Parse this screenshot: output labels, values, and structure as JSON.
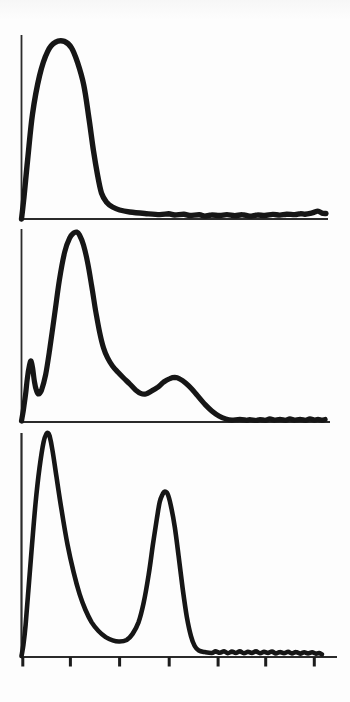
{
  "figure": {
    "kind": "scanned three-panel histogram figure",
    "background_color": "#fdfdfd",
    "ink_color": "#161616",
    "text": ""
  },
  "chart_data": [
    {
      "type": "line",
      "id": "panel-top",
      "title": "",
      "xlabel": "",
      "ylabel": "",
      "x_range": [
        0,
        100
      ],
      "y_range": [
        0,
        100
      ],
      "grid": false,
      "legend": "none",
      "units": "percent of axis span",
      "description": "Single broad peak near origin (apex ~14,96) with steep decay and long flat noisy tail",
      "points": [
        [
          0,
          0
        ],
        [
          0.7,
          10
        ],
        [
          2,
          32
        ],
        [
          3.6,
          57
        ],
        [
          5.9,
          78
        ],
        [
          8.5,
          91
        ],
        [
          11,
          96
        ],
        [
          14,
          96.5
        ],
        [
          16.3,
          93
        ],
        [
          18.3,
          85
        ],
        [
          20.3,
          73
        ],
        [
          21.9,
          56
        ],
        [
          23.5,
          37
        ],
        [
          24.8,
          24
        ],
        [
          26.1,
          14
        ],
        [
          27.8,
          9
        ],
        [
          29.7,
          6.5
        ],
        [
          32,
          4.9
        ],
        [
          35.3,
          3.8
        ],
        [
          40.2,
          3
        ],
        [
          45.1,
          2.4
        ],
        [
          48,
          2.8
        ],
        [
          50,
          2.2
        ],
        [
          53,
          2.6
        ],
        [
          54.9,
          1.9
        ],
        [
          58,
          2.3
        ],
        [
          59.8,
          1.6
        ],
        [
          62,
          2.2
        ],
        [
          64.7,
          1.9
        ],
        [
          67,
          2.4
        ],
        [
          69.6,
          1.8
        ],
        [
          72,
          2.3
        ],
        [
          74.5,
          1.6
        ],
        [
          77,
          2.2
        ],
        [
          79.4,
          1.9
        ],
        [
          82,
          2.5
        ],
        [
          84.3,
          2.1
        ],
        [
          86.5,
          2.6
        ],
        [
          89.2,
          2.4
        ],
        [
          91,
          2.9
        ],
        [
          92.5,
          2.6
        ],
        [
          94.8,
          3.3
        ],
        [
          96.7,
          4.3
        ],
        [
          98,
          3.2
        ],
        [
          99.3,
          3
        ]
      ]
    },
    {
      "type": "line",
      "id": "panel-middle",
      "title": "",
      "xlabel": "",
      "ylabel": "",
      "x_range": [
        0,
        100
      ],
      "y_range": [
        0,
        100
      ],
      "grid": false,
      "legend": "none",
      "units": "percent of axis span",
      "description": "Small sharp spike at ~3,32, tall main peak at ~18,98, shoulder decay, broad secondary bump at ~50,23, flat noisy tail",
      "points": [
        [
          0,
          0.5
        ],
        [
          0.6,
          6.2
        ],
        [
          1.3,
          14
        ],
        [
          1.9,
          22.8
        ],
        [
          2.6,
          29.5
        ],
        [
          3.1,
          31.6
        ],
        [
          3.6,
          28
        ],
        [
          4.2,
          20.7
        ],
        [
          4.9,
          16.1
        ],
        [
          5.5,
          14.5
        ],
        [
          6.5,
          16.6
        ],
        [
          7.8,
          24.4
        ],
        [
          9.1,
          37.3
        ],
        [
          10.7,
          55.4
        ],
        [
          12.3,
          73.6
        ],
        [
          14,
          88.1
        ],
        [
          15.6,
          95.3
        ],
        [
          16.9,
          97.9
        ],
        [
          17.9,
          98.4
        ],
        [
          18.8,
          96.9
        ],
        [
          20.1,
          91.7
        ],
        [
          21.4,
          82.9
        ],
        [
          22.7,
          71
        ],
        [
          24,
          58
        ],
        [
          25.3,
          46.6
        ],
        [
          26.6,
          38.3
        ],
        [
          27.9,
          33.2
        ],
        [
          29.5,
          29
        ],
        [
          31.2,
          25.9
        ],
        [
          33.1,
          22.8
        ],
        [
          35.1,
          19.7
        ],
        [
          37,
          16.6
        ],
        [
          38.6,
          14.8
        ],
        [
          40.3,
          14.5
        ],
        [
          42.2,
          16.1
        ],
        [
          44.2,
          18.1
        ],
        [
          46.1,
          20.7
        ],
        [
          48.1,
          22.5
        ],
        [
          49.7,
          23.1
        ],
        [
          51.3,
          22.3
        ],
        [
          53.2,
          20.2
        ],
        [
          55.2,
          17.1
        ],
        [
          57.1,
          13.5
        ],
        [
          59.4,
          9.3
        ],
        [
          61.7,
          5.7
        ],
        [
          64,
          3.1
        ],
        [
          66.2,
          1.6
        ],
        [
          68.2,
          1
        ],
        [
          70.8,
          1.4
        ],
        [
          73,
          0.9
        ],
        [
          74,
          1.3
        ],
        [
          76,
          0.8
        ],
        [
          77.3,
          1.3
        ],
        [
          79,
          0.9
        ],
        [
          80.5,
          1.6
        ],
        [
          82,
          1
        ],
        [
          83.8,
          1.4
        ],
        [
          85.5,
          0.9
        ],
        [
          87,
          1.6
        ],
        [
          88.5,
          1
        ],
        [
          90.3,
          1.4
        ],
        [
          92,
          0.9
        ],
        [
          93.5,
          1.6
        ],
        [
          95,
          1
        ],
        [
          96.1,
          1.4
        ],
        [
          97.3,
          1
        ],
        [
          98.4,
          1.3
        ]
      ]
    },
    {
      "type": "line",
      "id": "panel-bottom",
      "title": "",
      "xlabel": "",
      "ylabel": "",
      "x_range": [
        0,
        100
      ],
      "y_range": [
        0,
        100
      ],
      "grid": false,
      "legend": "none",
      "units": "percent of axis span",
      "description": "Tall narrow peak at ~8,100 and second narrow peak at ~45,74 with flat noisy tail; x axis has 7 tick marks",
      "x_ticks": [
        0.4,
        15.5,
        31.1,
        46.8,
        62.3,
        77.4,
        92.8
      ],
      "points": [
        [
          0,
          0.4
        ],
        [
          0.6,
          5.4
        ],
        [
          1.3,
          14.3
        ],
        [
          2.2,
          29.9
        ],
        [
          3.2,
          47.8
        ],
        [
          4.4,
          67.9
        ],
        [
          5.7,
          84.4
        ],
        [
          7,
          96
        ],
        [
          7.9,
          99.6
        ],
        [
          8.4,
          100
        ],
        [
          8.9,
          98.7
        ],
        [
          9.8,
          92.4
        ],
        [
          11.1,
          80.4
        ],
        [
          12.7,
          65.6
        ],
        [
          14.6,
          50
        ],
        [
          16.5,
          37.9
        ],
        [
          18.4,
          28.1
        ],
        [
          20.3,
          21
        ],
        [
          22.2,
          15.6
        ],
        [
          24.4,
          11.6
        ],
        [
          26.7,
          8.9
        ],
        [
          28.9,
          7.4
        ],
        [
          31.1,
          6.9
        ],
        [
          33.3,
          7.6
        ],
        [
          35.2,
          10.3
        ],
        [
          37.1,
          15.6
        ],
        [
          38.7,
          24.1
        ],
        [
          40.3,
          36.6
        ],
        [
          41.6,
          49.6
        ],
        [
          42.9,
          61.6
        ],
        [
          43.8,
          69.2
        ],
        [
          44.8,
          72.8
        ],
        [
          45.4,
          73.9
        ],
        [
          46.3,
          72.8
        ],
        [
          47.3,
          67.9
        ],
        [
          48.6,
          58
        ],
        [
          49.8,
          45.1
        ],
        [
          51.1,
          30.4
        ],
        [
          52.4,
          17.9
        ],
        [
          53.7,
          9.4
        ],
        [
          54.9,
          4.9
        ],
        [
          56.2,
          2.9
        ],
        [
          58.1,
          2.2
        ],
        [
          60.3,
          1.8
        ],
        [
          61.5,
          2.5
        ],
        [
          62.9,
          1.9
        ],
        [
          64.2,
          2.6
        ],
        [
          65.4,
          1.7
        ],
        [
          66.7,
          2.4
        ],
        [
          67.9,
          1.8
        ],
        [
          69.2,
          2.5
        ],
        [
          70.5,
          1.7
        ],
        [
          71.8,
          2.3
        ],
        [
          73,
          1.8
        ],
        [
          74.3,
          2.5
        ],
        [
          75.6,
          1.7
        ],
        [
          76.9,
          2.3
        ],
        [
          78.1,
          1.8
        ],
        [
          79.4,
          2.4
        ],
        [
          80.6,
          1.6
        ],
        [
          81.9,
          2.2
        ],
        [
          83.2,
          1.7
        ],
        [
          84.5,
          2.3
        ],
        [
          85.7,
          1.6
        ],
        [
          87,
          2.2
        ],
        [
          88.3,
          1.5
        ],
        [
          89.6,
          2.1
        ],
        [
          90.8,
          1.6
        ],
        [
          92.1,
          2.1
        ],
        [
          93.3,
          1.5
        ],
        [
          94.3,
          1.8
        ],
        [
          95.2,
          1.2
        ]
      ]
    }
  ]
}
